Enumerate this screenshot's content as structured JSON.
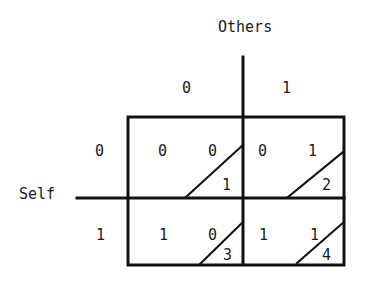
{
  "axes": {
    "column_title": "Others",
    "row_title": "Self",
    "column_labels": [
      "0",
      "1"
    ],
    "row_labels": [
      "0",
      "1"
    ]
  },
  "cells": [
    {
      "self": "0",
      "others": "0",
      "left": "0",
      "right": "0",
      "index": "1"
    },
    {
      "self": "0",
      "others": "1",
      "left": "0",
      "right": "1",
      "index": "2"
    },
    {
      "self": "1",
      "others": "0",
      "left": "1",
      "right": "0",
      "index": "3"
    },
    {
      "self": "1",
      "others": "1",
      "left": "1",
      "right": "1",
      "index": "4"
    }
  ]
}
